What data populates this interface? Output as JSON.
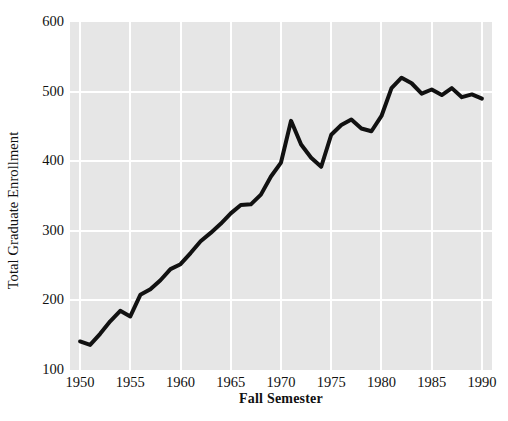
{
  "chart_data": {
    "type": "line",
    "title": "",
    "xlabel": "Fall Semester",
    "ylabel": "Total Graduate Enrollment",
    "xlim": [
      1949,
      1991
    ],
    "ylim": [
      100,
      600
    ],
    "xticks": [
      1950,
      1955,
      1960,
      1965,
      1970,
      1975,
      1980,
      1985,
      1990
    ],
    "xtick_labels": [
      "1950",
      "1955",
      "1960",
      "1965",
      "1970",
      "1975",
      "1980",
      "1985",
      "1990"
    ],
    "yticks": [
      100,
      200,
      300,
      400,
      500,
      600
    ],
    "ytick_labels": [
      "100",
      "200",
      "300",
      "400",
      "500",
      "600"
    ],
    "grid": true,
    "grid_color": "#ffffff",
    "panel_color": "#e6e6e6",
    "line_color": "#111111",
    "line_width": 4,
    "legend": null,
    "x": [
      1950,
      1951,
      1952,
      1953,
      1954,
      1955,
      1956,
      1957,
      1958,
      1959,
      1960,
      1961,
      1962,
      1963,
      1964,
      1965,
      1966,
      1967,
      1968,
      1969,
      1970,
      1971,
      1972,
      1973,
      1974,
      1975,
      1976,
      1977,
      1978,
      1979,
      1980,
      1981,
      1982,
      1983,
      1984,
      1985,
      1986,
      1987,
      1988,
      1989,
      1990
    ],
    "values": [
      141,
      136,
      152,
      170,
      185,
      177,
      208,
      216,
      229,
      245,
      252,
      268,
      285,
      297,
      310,
      325,
      337,
      338,
      352,
      378,
      398,
      458,
      424,
      405,
      392,
      438,
      452,
      460,
      447,
      443,
      465,
      505,
      520,
      512,
      497,
      503,
      495,
      505,
      492,
      496,
      490
    ],
    "series": [
      {
        "name": "Total Graduate Enrollment",
        "values": [
          141,
          136,
          152,
          170,
          185,
          177,
          208,
          216,
          229,
          245,
          252,
          268,
          285,
          297,
          310,
          325,
          337,
          338,
          352,
          378,
          398,
          458,
          424,
          405,
          392,
          438,
          452,
          460,
          447,
          443,
          465,
          505,
          520,
          512,
          497,
          503,
          495,
          505,
          492,
          496,
          490
        ]
      }
    ]
  }
}
